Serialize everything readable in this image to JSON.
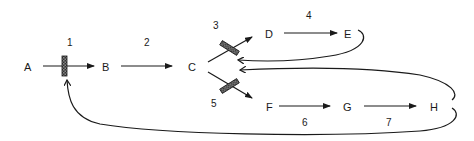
{
  "diagram": {
    "type": "regulatory-pathway",
    "nodes": {
      "A": "A",
      "B": "B",
      "C": "C",
      "D": "D",
      "E": "E",
      "F": "F",
      "G": "G",
      "H": "H"
    },
    "steps": {
      "s1": "1",
      "s2": "2",
      "s3": "3",
      "s4": "4",
      "s5": "5",
      "s6": "6",
      "s7": "7"
    },
    "edges": [
      {
        "from": "A",
        "to": "B",
        "label": "1",
        "type": "reaction",
        "regulated": true
      },
      {
        "from": "B",
        "to": "C",
        "label": "2",
        "type": "reaction"
      },
      {
        "from": "C",
        "to": "D",
        "label": "3",
        "type": "reaction",
        "regulated": true
      },
      {
        "from": "D",
        "to": "E",
        "label": "4",
        "type": "reaction"
      },
      {
        "from": "C",
        "to": "F",
        "label": "5",
        "type": "reaction",
        "regulated": true
      },
      {
        "from": "F",
        "to": "G",
        "label": "6",
        "type": "reaction"
      },
      {
        "from": "G",
        "to": "H",
        "label": "7",
        "type": "reaction"
      },
      {
        "from": "E",
        "to": "step-3",
        "type": "feedback-inhibition"
      },
      {
        "from": "H",
        "to": "step-5",
        "type": "feedback-inhibition"
      },
      {
        "from": "H",
        "to": "step-1",
        "type": "feedback-inhibition"
      }
    ],
    "colors": {
      "line": "#1a1a1a",
      "background": "#ffffff"
    }
  }
}
